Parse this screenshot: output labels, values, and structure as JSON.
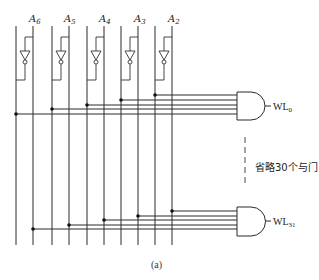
{
  "diagram": {
    "inputs": [
      {
        "name": "A",
        "sub": "6"
      },
      {
        "name": "A",
        "sub": "5"
      },
      {
        "name": "A",
        "sub": "4"
      },
      {
        "name": "A",
        "sub": "3"
      },
      {
        "name": "A",
        "sub": "2"
      }
    ],
    "outputs": [
      {
        "name": "WL",
        "sub": "0"
      },
      {
        "name": "WL",
        "sub": "31"
      }
    ],
    "omitted_note": "省略30个与门",
    "caption": "(a)"
  }
}
